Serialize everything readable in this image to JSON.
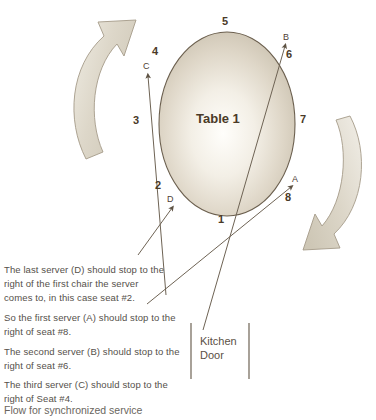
{
  "diagram": {
    "title_label": "Table 1",
    "caption": "Flow for synchronized service",
    "kitchen_door_label": "Kitchen\nDoor",
    "seats": [
      {
        "id": "seat-1",
        "label": "1",
        "x": 218,
        "y": 214
      },
      {
        "id": "seat-2",
        "label": "2",
        "x": 155,
        "y": 180
      },
      {
        "id": "seat-3",
        "label": "3",
        "x": 133,
        "y": 115
      },
      {
        "id": "seat-4",
        "label": "4",
        "x": 152,
        "y": 46
      },
      {
        "id": "seat-5",
        "label": "5",
        "x": 222,
        "y": 16
      },
      {
        "id": "seat-6",
        "label": "6",
        "x": 286,
        "y": 49
      },
      {
        "id": "seat-7",
        "label": "7",
        "x": 300,
        "y": 114
      },
      {
        "id": "seat-8",
        "label": "8",
        "x": 285,
        "y": 192
      }
    ],
    "servers": [
      {
        "id": "server-a",
        "label": "A",
        "x": 292,
        "y": 175
      },
      {
        "id": "server-b",
        "label": "B",
        "x": 283,
        "y": 33
      },
      {
        "id": "server-c",
        "label": "C",
        "x": 143,
        "y": 62
      },
      {
        "id": "server-d",
        "label": "D",
        "x": 167,
        "y": 195
      }
    ],
    "notes": [
      {
        "id": "note-last-server",
        "text": "The last server (D) should stop to the\nright of the first chair the server\ncomes to, in this case seat #2."
      },
      {
        "id": "note-first-server",
        "text": "So the first server (A) should stop to the\nright of seat #8."
      },
      {
        "id": "note-second-server",
        "text": "The second server (B) should stop to the\nright of seat #6."
      },
      {
        "id": "note-third-server",
        "text": "The third server (C) should stop to the\nright of Seat #4."
      }
    ]
  },
  "colors": {
    "table_fill_center": "#fdfcf8",
    "table_fill_edge": "#cdc4b4",
    "table_stroke": "#6b5f4e",
    "arrow_fill": "#ded8cb",
    "arrow_stroke": "#9a917f",
    "line_stroke": "#6e6354",
    "text_dark": "#4a3a28",
    "text_body": "#55504a",
    "background": "#ffffff"
  }
}
